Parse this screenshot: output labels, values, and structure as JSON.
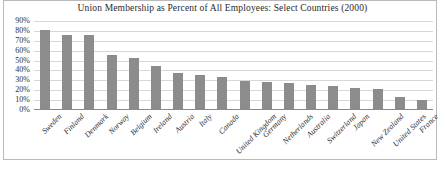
{
  "chart_data": {
    "type": "bar",
    "title": "Union Membership as Percent of All Employees: Select Countries (2000)",
    "xlabel": "",
    "ylabel": "",
    "ylim": [
      0,
      90
    ],
    "grid": true,
    "legend": "none",
    "ytick_labels": [
      "90%",
      "80%",
      "70%",
      "60%",
      "50%",
      "40%",
      "30%",
      "20%",
      "10%",
      "0%"
    ],
    "ytick_values": [
      90,
      80,
      70,
      60,
      50,
      40,
      30,
      20,
      10,
      0
    ],
    "categories": [
      "Sweden",
      "Finland",
      "Denmark",
      "Norway",
      "Belgium",
      "Ireland",
      "Austria",
      "Italy",
      "Canada",
      "United Kingdom",
      "Germany",
      "Netherlands",
      "Australia",
      "Switzerland",
      "Japan",
      "New Zealand",
      "United States",
      "France"
    ],
    "values": [
      81,
      76,
      76,
      56,
      53,
      45,
      37,
      35,
      33,
      29,
      28,
      27,
      25,
      24,
      22,
      21,
      13,
      10
    ],
    "series": [
      {
        "name": "Union membership",
        "values": [
          81,
          76,
          76,
          56,
          53,
          45,
          37,
          35,
          33,
          29,
          28,
          27,
          25,
          24,
          22,
          21,
          13,
          10
        ]
      }
    ],
    "bar_color": "#8c8c8c",
    "grid_color": "#d7d7d7",
    "axis_color": "#8a8a8a",
    "text_color": "#2e2e2e",
    "background_color": "#ffffff"
  }
}
